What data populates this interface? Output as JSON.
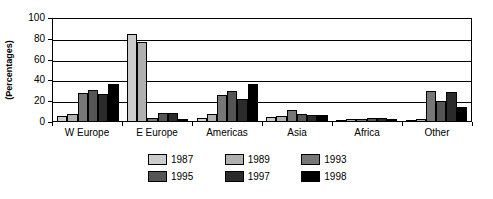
{
  "chart_data": {
    "type": "bar",
    "title": "",
    "xlabel": "",
    "ylabel": "(Percentages)",
    "ylim": [
      0,
      100
    ],
    "yticks": [
      0,
      20,
      40,
      60,
      80,
      100
    ],
    "grid": true,
    "legend_position": "bottom",
    "categories": [
      "W Europe",
      "E Europe",
      "Americas",
      "Asia",
      "Africa",
      "Other"
    ],
    "series": [
      {
        "name": "1987",
        "color": "#cccccc",
        "values": [
          5,
          84,
          3,
          4,
          1,
          1
        ]
      },
      {
        "name": "1989",
        "color": "#b0b0b0",
        "values": [
          7,
          76,
          7,
          5,
          2,
          2
        ]
      },
      {
        "name": "1993",
        "color": "#777777",
        "values": [
          27,
          3,
          25,
          11,
          2,
          29
        ]
      },
      {
        "name": "1995",
        "color": "#555555",
        "values": [
          30,
          8,
          29,
          7,
          3,
          19
        ]
      },
      {
        "name": "1997",
        "color": "#2b2b2b",
        "values": [
          26,
          8,
          21,
          6,
          3,
          28
        ]
      },
      {
        "name": "1998",
        "color": "#000000",
        "values": [
          36,
          2,
          36,
          6,
          2,
          13
        ]
      }
    ]
  },
  "axis": {
    "y_label": "(Percentages)",
    "y_ticks": [
      "100",
      "80",
      "60",
      "40",
      "20",
      "0"
    ]
  },
  "legend": {
    "items": [
      {
        "label": "1987"
      },
      {
        "label": "1989"
      },
      {
        "label": "1993"
      },
      {
        "label": "1995"
      },
      {
        "label": "1997"
      },
      {
        "label": "1998"
      }
    ]
  }
}
